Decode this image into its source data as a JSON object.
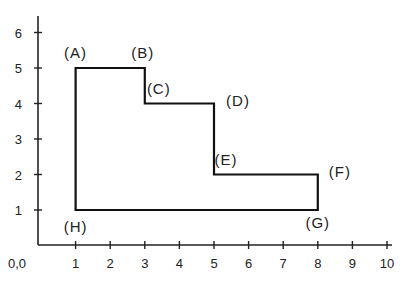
{
  "chart_data": {
    "type": "diagram",
    "title": "",
    "origin_label": "0,0",
    "x_ticks": [
      1,
      2,
      3,
      4,
      5,
      6,
      7,
      8,
      9,
      10
    ],
    "y_ticks": [
      1,
      2,
      3,
      4,
      5,
      6
    ],
    "xlim": [
      0,
      10
    ],
    "ylim": [
      0,
      6
    ],
    "polygon": [
      {
        "name": "A",
        "x": 1,
        "y": 5,
        "label": "(A)"
      },
      {
        "name": "B",
        "x": 3,
        "y": 5,
        "label": "(B)"
      },
      {
        "name": "C",
        "x": 3,
        "y": 4,
        "label": "(C)"
      },
      {
        "name": "D",
        "x": 5,
        "y": 4,
        "label": "(D)"
      },
      {
        "name": "E",
        "x": 5,
        "y": 2,
        "label": "(E)"
      },
      {
        "name": "F",
        "x": 8,
        "y": 2,
        "label": "(F)"
      },
      {
        "name": "G",
        "x": 8,
        "y": 1,
        "label": "(G)"
      },
      {
        "name": "H",
        "x": 1,
        "y": 1,
        "label": "(H)"
      }
    ]
  },
  "colors": {
    "line": "#111111",
    "text": "#222222"
  }
}
